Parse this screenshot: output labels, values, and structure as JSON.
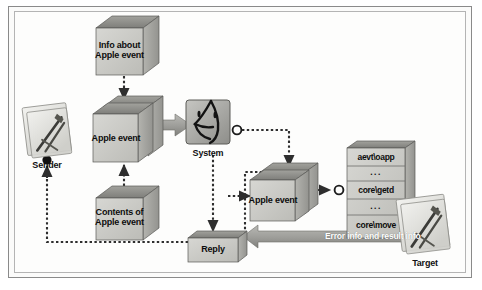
{
  "diagram": {
    "colors": {
      "cube_front": "#c9c9c5",
      "cube_top": "#8f8f8b",
      "cube_side": "#a8a8a3",
      "thick_arrow": "#9a9a96",
      "dotted_line": "#3b3b3b",
      "frame": "#8a8a8a",
      "text": "#111111"
    }
  },
  "nodes": {
    "info_cube": {
      "label": "Info about\nApple event"
    },
    "apple_event_left": {
      "label": "Apple event"
    },
    "contents_cube": {
      "label": "Contents of\nApple event"
    },
    "apple_event_right": {
      "label": "Apple event"
    },
    "reply_box": {
      "label": "Reply"
    }
  },
  "actors": {
    "sender": {
      "label": "Sender",
      "icon": "document-with-pen-icon"
    },
    "system": {
      "label": "System",
      "icon": "mac-finder-face-icon"
    },
    "target": {
      "label": "Target",
      "icon": "document-with-pen-icon"
    }
  },
  "event_table": {
    "name": "apple-event-registry",
    "rows": [
      "aevt\\oapp",
      "...",
      "core\\getd",
      "...",
      "core\\move"
    ]
  },
  "arrows": {
    "return_path": {
      "label": "Error info and result info"
    }
  }
}
